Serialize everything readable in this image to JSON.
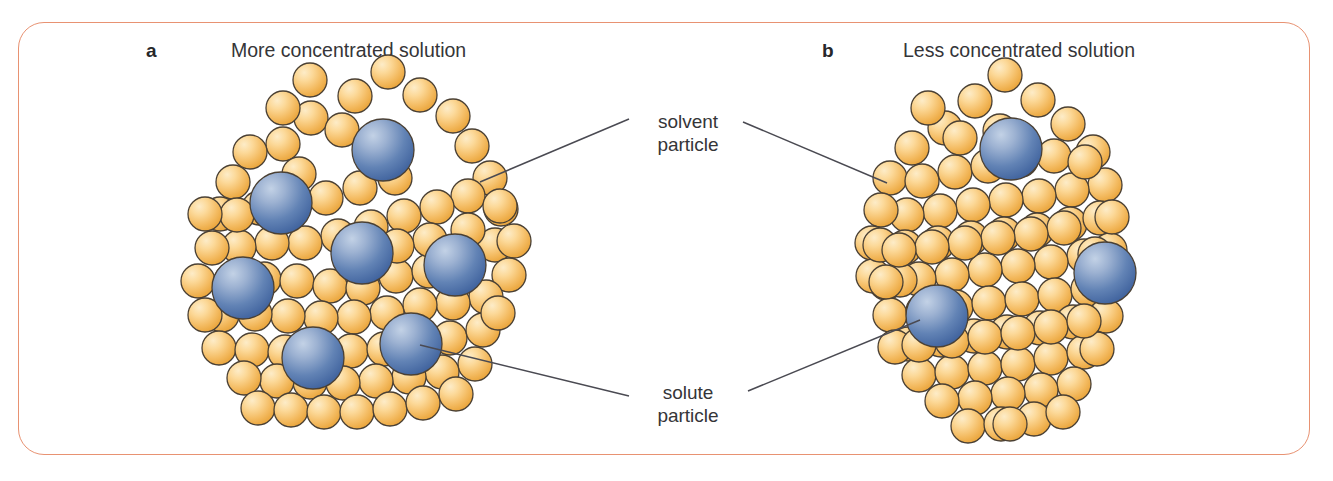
{
  "figure": {
    "type": "diagram",
    "frame_color": "#e89272",
    "background_color": "#ffffff",
    "text_color": "#353538"
  },
  "panels": [
    {
      "letter": "a",
      "title": "More concentrated solution",
      "solute_count": 7,
      "solvent_count": 84,
      "description": "Many blue solute particles dispersed among orange solvent particles"
    },
    {
      "letter": "b",
      "title": "Less concentrated solution",
      "solute_count": 3,
      "solvent_count": 92,
      "description": "Few blue solute particles dispersed among orange solvent particles"
    }
  ],
  "callouts": [
    {
      "id": "solvent",
      "line1": "solvent",
      "line2": "particle",
      "points_to": "orange-sphere"
    },
    {
      "id": "solute",
      "line1": "solute",
      "line2": "particle",
      "points_to": "blue-sphere"
    }
  ],
  "legend": {
    "solvent_particle_color": "#f0b452",
    "solvent_highlight_color": "#fde3b0",
    "solute_particle_color": "#4c6ea8",
    "solute_highlight_color": "#a8bdd8",
    "leader_line_color": "#4a4a52"
  },
  "geometry": {
    "solvent_radius": 17,
    "solute_radius": 31,
    "panel_a_solvents": [
      [
        388,
        72
      ],
      [
        355,
        96
      ],
      [
        420,
        95
      ],
      [
        311,
        118
      ],
      [
        453,
        116
      ],
      [
        283,
        144
      ],
      [
        472,
        146
      ],
      [
        299,
        174
      ],
      [
        250,
        152
      ],
      [
        233,
        182
      ],
      [
        220,
        214
      ],
      [
        259,
        208
      ],
      [
        293,
        207
      ],
      [
        326,
        198
      ],
      [
        360,
        188
      ],
      [
        395,
        178
      ],
      [
        490,
        178
      ],
      [
        501,
        209
      ],
      [
        468,
        196
      ],
      [
        437,
        207
      ],
      [
        404,
        216
      ],
      [
        371,
        227
      ],
      [
        338,
        236
      ],
      [
        305,
        243
      ],
      [
        272,
        243
      ],
      [
        239,
        247
      ],
      [
        212,
        248
      ],
      [
        198,
        281
      ],
      [
        231,
        281
      ],
      [
        264,
        279
      ],
      [
        297,
        281
      ],
      [
        330,
        286
      ],
      [
        363,
        288
      ],
      [
        396,
        276
      ],
      [
        429,
        271
      ],
      [
        462,
        262
      ],
      [
        495,
        245
      ],
      [
        514,
        241
      ],
      [
        509,
        275
      ],
      [
        486,
        297
      ],
      [
        453,
        303
      ],
      [
        420,
        305
      ],
      [
        387,
        313
      ],
      [
        354,
        317
      ],
      [
        321,
        318
      ],
      [
        288,
        316
      ],
      [
        255,
        314
      ],
      [
        222,
        315
      ],
      [
        205,
        315
      ],
      [
        219,
        348
      ],
      [
        252,
        350
      ],
      [
        285,
        352
      ],
      [
        318,
        350
      ],
      [
        351,
        351
      ],
      [
        384,
        349
      ],
      [
        417,
        345
      ],
      [
        450,
        338
      ],
      [
        483,
        330
      ],
      [
        498,
        313
      ],
      [
        475,
        364
      ],
      [
        442,
        372
      ],
      [
        409,
        377
      ],
      [
        376,
        381
      ],
      [
        343,
        383
      ],
      [
        310,
        382
      ],
      [
        277,
        381
      ],
      [
        244,
        378
      ],
      [
        258,
        408
      ],
      [
        291,
        410
      ],
      [
        324,
        412
      ],
      [
        357,
        412
      ],
      [
        390,
        409
      ],
      [
        423,
        403
      ],
      [
        456,
        394
      ],
      [
        283,
        108
      ],
      [
        342,
        130
      ],
      [
        310,
        80
      ],
      [
        237,
        215
      ],
      [
        205,
        214
      ],
      [
        468,
        230
      ],
      [
        500,
        206
      ],
      [
        430,
        240
      ],
      [
        397,
        246
      ],
      [
        364,
        256
      ]
    ],
    "panel_a_solutes": [
      [
        383,
        150
      ],
      [
        281,
        203
      ],
      [
        362,
        253
      ],
      [
        455,
        265
      ],
      [
        243,
        288
      ],
      [
        313,
        358
      ],
      [
        411,
        344
      ]
    ],
    "panel_b_solvents": [
      [
        1005,
        75
      ],
      [
        975,
        101
      ],
      [
        1038,
        100
      ],
      [
        945,
        128
      ],
      [
        1068,
        124
      ],
      [
        912,
        148
      ],
      [
        1093,
        152
      ],
      [
        890,
        178
      ],
      [
        1105,
        185
      ],
      [
        922,
        181
      ],
      [
        955,
        172
      ],
      [
        988,
        166
      ],
      [
        1021,
        160
      ],
      [
        1054,
        156
      ],
      [
        1072,
        190
      ],
      [
        1039,
        196
      ],
      [
        1006,
        200
      ],
      [
        973,
        205
      ],
      [
        940,
        211
      ],
      [
        907,
        215
      ],
      [
        881,
        210
      ],
      [
        872,
        243
      ],
      [
        905,
        247
      ],
      [
        938,
        243
      ],
      [
        971,
        238
      ],
      [
        1004,
        234
      ],
      [
        1037,
        230
      ],
      [
        1070,
        224
      ],
      [
        1100,
        218
      ],
      [
        1110,
        250
      ],
      [
        1084,
        256
      ],
      [
        1051,
        262
      ],
      [
        1018,
        266
      ],
      [
        985,
        270
      ],
      [
        952,
        275
      ],
      [
        919,
        279
      ],
      [
        886,
        283
      ],
      [
        873,
        276
      ],
      [
        890,
        315
      ],
      [
        923,
        311
      ],
      [
        956,
        307
      ],
      [
        989,
        303
      ],
      [
        1022,
        299
      ],
      [
        1055,
        295
      ],
      [
        1088,
        289
      ],
      [
        1113,
        283
      ],
      [
        1106,
        316
      ],
      [
        1073,
        322
      ],
      [
        1040,
        328
      ],
      [
        1007,
        332
      ],
      [
        974,
        336
      ],
      [
        941,
        340
      ],
      [
        908,
        344
      ],
      [
        895,
        347
      ],
      [
        919,
        375
      ],
      [
        952,
        372
      ],
      [
        985,
        368
      ],
      [
        1018,
        364
      ],
      [
        1051,
        358
      ],
      [
        1084,
        352
      ],
      [
        1097,
        349
      ],
      [
        1074,
        384
      ],
      [
        1041,
        390
      ],
      [
        1008,
        394
      ],
      [
        975,
        398
      ],
      [
        942,
        401
      ],
      [
        968,
        426
      ],
      [
        1001,
        424
      ],
      [
        1034,
        419
      ],
      [
        1063,
        412
      ],
      [
        1010,
        424
      ],
      [
        928,
        108
      ],
      [
        1000,
        131
      ],
      [
        960,
        138
      ],
      [
        1085,
        162
      ],
      [
        880,
        245
      ],
      [
        900,
        280
      ],
      [
        1112,
        217
      ],
      [
        1095,
        254
      ],
      [
        1064,
        228
      ],
      [
        1031,
        234
      ],
      [
        998,
        238
      ],
      [
        965,
        243
      ],
      [
        932,
        247
      ],
      [
        899,
        250
      ],
      [
        886,
        282
      ],
      [
        919,
        345
      ],
      [
        952,
        341
      ],
      [
        985,
        337
      ],
      [
        1018,
        333
      ],
      [
        1051,
        327
      ],
      [
        1084,
        321
      ],
      [
        1110,
        285
      ]
    ],
    "panel_b_solutes": [
      [
        1011,
        149
      ],
      [
        937,
        316
      ],
      [
        1105,
        273
      ]
    ],
    "leader_lines": [
      {
        "name": "solvent-left",
        "x1": 887,
        "y1": 183,
        "x2": 743,
        "y2": 122
      },
      {
        "name": "solvent-right",
        "x1": 480,
        "y1": 182,
        "x2": 629,
        "y2": 119
      },
      {
        "name": "solute-left",
        "x1": 920,
        "y1": 320,
        "x2": 748,
        "y2": 391
      },
      {
        "name": "solute-right",
        "x1": 420,
        "y1": 345,
        "x2": 629,
        "y2": 396
      }
    ]
  }
}
